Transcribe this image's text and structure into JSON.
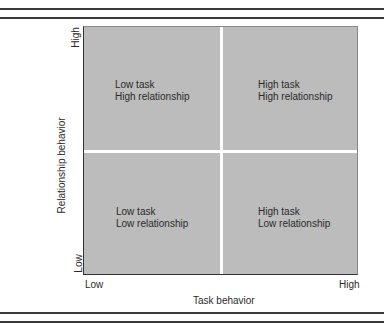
{
  "diagram": {
    "type": "2x2 matrix",
    "x_axis": {
      "label": "Task behavior",
      "low": "Low",
      "high": "High"
    },
    "y_axis": {
      "label": "Relationship behavior",
      "low": "Low",
      "high": "High"
    },
    "quadrants": {
      "top_left": {
        "line1": "Low task",
        "line2": "High relationship"
      },
      "top_right": {
        "line1": "High task",
        "line2": "High relationship"
      },
      "bottom_left": {
        "line1": "Low task",
        "line2": "Low relationship"
      },
      "bottom_right": {
        "line1": "High task",
        "line2": "Low relationship"
      }
    },
    "colors": {
      "plot_background": "#bcbcbc",
      "divider": "#ffffff",
      "rule": "#3a3a3a",
      "text": "#2a2a2a"
    }
  }
}
